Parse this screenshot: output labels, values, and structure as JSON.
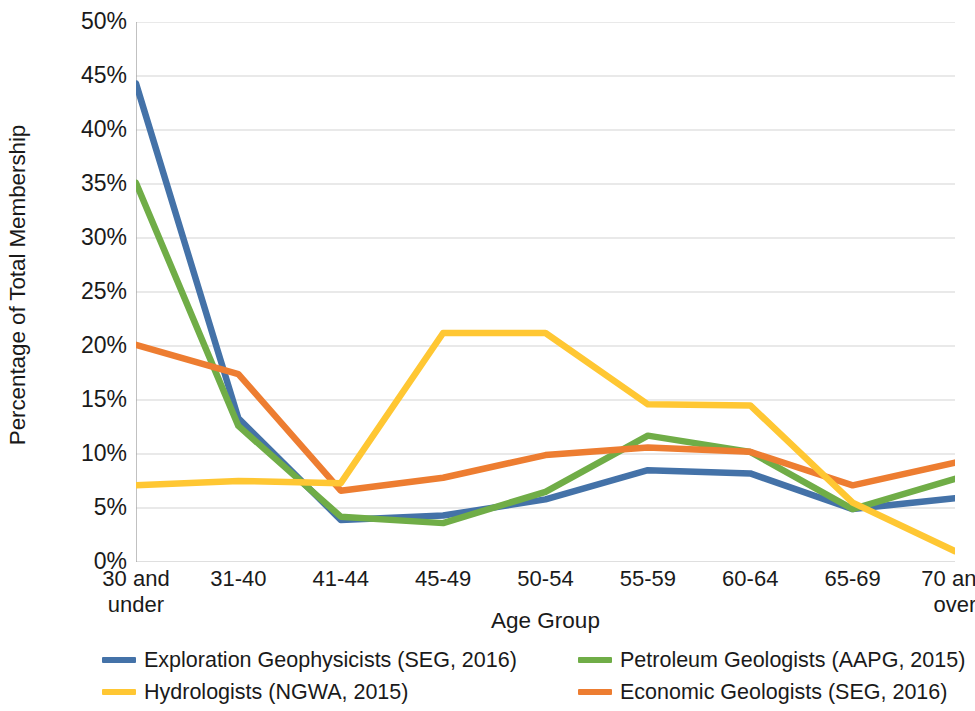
{
  "chart_data": {
    "type": "line",
    "title": "",
    "xlabel": "Age Group",
    "ylabel": "Percentage of Total Membership",
    "categories": [
      "30 and under",
      "31-40",
      "41-44",
      "45-49",
      "50-54",
      "55-59",
      "60-64",
      "65-69",
      "70 and over"
    ],
    "ylim": [
      0,
      50
    ],
    "ytick_labels": [
      "0%",
      "5%",
      "10%",
      "15%",
      "20%",
      "25%",
      "30%",
      "35%",
      "40%",
      "45%",
      "50%"
    ],
    "ytick_values": [
      0,
      5,
      10,
      15,
      20,
      25,
      30,
      35,
      40,
      45,
      50
    ],
    "grid": "horizontal",
    "legend_position": "bottom",
    "series": [
      {
        "name": "Exploration Geophysicists (SEG, 2016)",
        "color": "#4472a8",
        "values": [
          44.3,
          13.3,
          3.9,
          4.3,
          5.8,
          8.5,
          8.2,
          4.9,
          5.9
        ]
      },
      {
        "name": "Petroleum Geologists (AAPG, 2015)",
        "color": "#70ad47",
        "values": [
          35.1,
          12.6,
          4.2,
          3.6,
          6.5,
          11.7,
          10.2,
          4.9,
          7.7
        ]
      },
      {
        "name": "Hydrologists (NGWA, 2015)",
        "color": "#ffc733",
        "values": [
          7.1,
          7.5,
          7.3,
          21.2,
          21.2,
          14.6,
          14.5,
          5.5,
          1.0
        ]
      },
      {
        "name": "Economic Geologists (SEG, 2016)",
        "color": "#ed7d31",
        "values": [
          20.1,
          17.4,
          6.6,
          7.8,
          9.9,
          10.6,
          10.2,
          7.1,
          9.2
        ]
      }
    ]
  },
  "axis": {
    "x_title": "Age Group",
    "y_title": "Percentage of Total Membership"
  },
  "colors": {
    "series_blue": "#4472a8",
    "series_green": "#70ad47",
    "series_yellow": "#ffc733",
    "series_orange": "#ed7d31",
    "gridline": "#d4d4d4",
    "axis": "#a6a6a6",
    "text": "#1a1a1a",
    "background": "#ffffff"
  },
  "legend": {
    "items": [
      {
        "label": "Exploration Geophysicists (SEG, 2016)",
        "color": "#4472a8"
      },
      {
        "label": "Petroleum Geologists (AAPG, 2015)",
        "color": "#70ad47"
      },
      {
        "label": "Hydrologists (NGWA, 2015)",
        "color": "#ffc733"
      },
      {
        "label": "Economic Geologists (SEG, 2016)",
        "color": "#ed7d31"
      }
    ]
  }
}
